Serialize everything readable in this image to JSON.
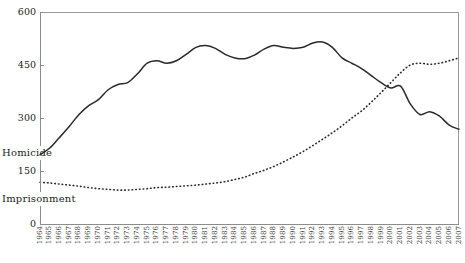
{
  "chart_data": {
    "type": "line",
    "title": "",
    "xlabel": "",
    "ylabel": "",
    "ylim": [
      0,
      600
    ],
    "yticks": [
      0,
      150,
      300,
      450,
      600
    ],
    "grid": false,
    "legend_position": "y-axis-inline",
    "x": [
      1964,
      1965,
      1966,
      1967,
      1968,
      1969,
      1970,
      1971,
      1972,
      1973,
      1974,
      1975,
      1976,
      1977,
      1978,
      1979,
      1980,
      1981,
      1982,
      1983,
      1984,
      1985,
      1986,
      1987,
      1988,
      1989,
      1990,
      1991,
      1992,
      1993,
      1994,
      1995,
      1996,
      1997,
      1998,
      1999,
      2000,
      2001,
      2002,
      2003,
      2004,
      2005,
      2006,
      2007
    ],
    "series": [
      {
        "name": "Homicide",
        "style": "solid",
        "color": "#2b2a2a",
        "values": [
          196,
          215,
          245,
          276,
          310,
          335,
          352,
          380,
          395,
          400,
          425,
          455,
          462,
          455,
          462,
          480,
          500,
          505,
          497,
          480,
          470,
          468,
          478,
          495,
          505,
          500,
          497,
          500,
          512,
          515,
          500,
          470,
          455,
          440,
          420,
          400,
          385,
          390,
          340,
          310,
          318,
          305,
          280,
          268
        ]
      },
      {
        "name": "Imprisonment",
        "style": "dotted",
        "color": "#2b2a2a",
        "values": [
          118,
          116,
          113,
          110,
          107,
          103,
          100,
          98,
          96,
          96,
          98,
          100,
          103,
          104,
          106,
          108,
          110,
          113,
          116,
          120,
          126,
          133,
          143,
          152,
          163,
          176,
          190,
          205,
          222,
          240,
          258,
          278,
          300,
          320,
          345,
          372,
          400,
          428,
          450,
          455,
          452,
          455,
          462,
          470
        ]
      }
    ],
    "axis_series_labels": [
      {
        "name": "Homicide",
        "value": 200
      },
      {
        "name": "Imprisonment",
        "value": 70
      }
    ]
  },
  "y_axis": {
    "ticks": [
      "600",
      "450",
      "300",
      "150",
      "0"
    ]
  },
  "x_axis": {
    "ticks": [
      "1964",
      "1965",
      "1966",
      "1967",
      "1968",
      "1969",
      "1970",
      "1971",
      "1972",
      "1973",
      "1974",
      "1975",
      "1976",
      "1977",
      "1978",
      "1979",
      "1980",
      "1981",
      "1982",
      "1983",
      "1984",
      "1985",
      "1986",
      "1987",
      "1988",
      "1989",
      "1990",
      "1991",
      "1992",
      "1993",
      "1994",
      "1995",
      "1996",
      "1997",
      "1998",
      "1999",
      "2000",
      "2001",
      "2002",
      "2003",
      "2004",
      "2005",
      "2006",
      "2007"
    ]
  }
}
